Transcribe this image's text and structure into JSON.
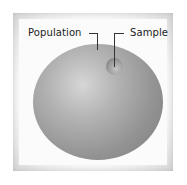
{
  "diagram": {
    "labels": {
      "population": "Population",
      "sample": "Sample"
    },
    "colors": {
      "frame": "#ececec",
      "population_sphere": "#9a9a9a",
      "sample_circle": "#8a8a8a",
      "label_text": "#222222"
    }
  }
}
